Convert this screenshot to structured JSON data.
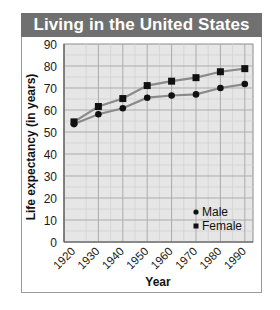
{
  "chart_data": {
    "type": "line",
    "title": "Living in the United States",
    "xlabel": "Year",
    "ylabel": "Life expectancy (in years)",
    "categories": [
      "1920",
      "1930",
      "1940",
      "1950",
      "1960",
      "1970",
      "1980",
      "1990"
    ],
    "series": [
      {
        "name": "Male",
        "marker": "circle",
        "values": [
          53.6,
          58.1,
          60.8,
          65.6,
          66.6,
          67.1,
          70.0,
          71.8
        ]
      },
      {
        "name": "Female",
        "marker": "square",
        "values": [
          54.6,
          61.6,
          65.2,
          71.1,
          73.1,
          74.7,
          77.4,
          78.8
        ]
      }
    ],
    "ylim": [
      0,
      90
    ],
    "yticks": [
      0,
      10,
      20,
      30,
      40,
      50,
      60,
      70,
      80,
      90
    ],
    "grid": true,
    "legend_position": "lower right",
    "colors": {
      "line": "#8a8a8a",
      "marker": "#111111",
      "plot_bg": "#e6e6e6",
      "title_bg": "#707070"
    }
  }
}
